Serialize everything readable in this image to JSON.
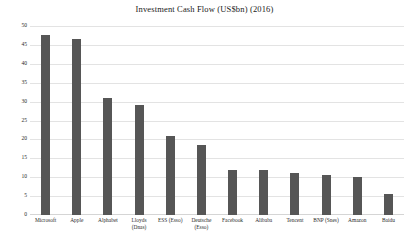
{
  "chart_data": {
    "type": "bar",
    "title": "Investment Cash Flow (US$bn) (2016)",
    "xlabel": "",
    "ylabel": "",
    "ylim": [
      0,
      50
    ],
    "yticks": [
      0,
      5,
      10,
      15,
      20,
      25,
      30,
      35,
      40,
      45,
      50
    ],
    "ytick_labels": [
      "0",
      "5",
      "10",
      "15",
      "20",
      "25",
      "30",
      "35",
      "40",
      "45",
      "50"
    ],
    "grid": true,
    "legend": "none",
    "bar_color": "#565656",
    "gridline_color": "#e3e3e3",
    "categories": [
      "Microsoft",
      "Apple",
      "Alphabet",
      "Lloyds\n(Dnas)",
      "ESS (Esso)",
      "Deutsche\n(Esso)",
      "Facebook",
      "Alibaba",
      "Tencent",
      "BNP (Snes)",
      "Amazon",
      "Baidu"
    ],
    "values": [
      47.5,
      46.5,
      31,
      29,
      21,
      18.5,
      12,
      12,
      11,
      10.5,
      10,
      5.5
    ]
  },
  "axis": {
    "y_unit": "US$bn"
  }
}
